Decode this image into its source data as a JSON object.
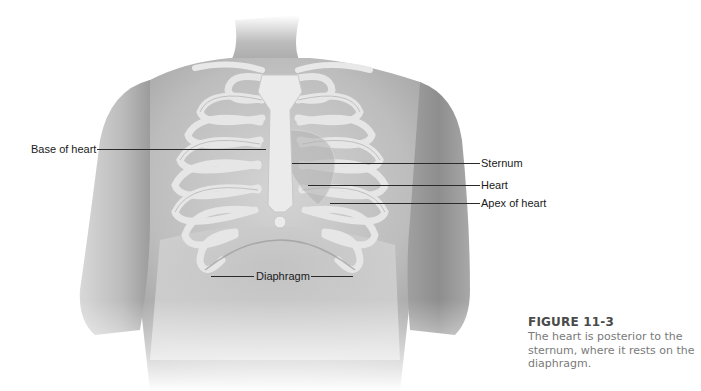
{
  "figure": {
    "illustration": "anterior-torso-rib-cage-heart",
    "labels": {
      "base_of_heart": "Base of heart",
      "sternum": "Sternum",
      "heart": "Heart",
      "apex_of_heart": "Apex of heart",
      "diaphragm": "Diaphragm"
    },
    "caption": {
      "title": "FIGURE 11-3",
      "text": "The heart is posterior to the sternum, where it rests on the diaphragm."
    },
    "colors": {
      "skin": "#c9c9c9",
      "skin_shadow": "#9e9e9e",
      "bone": "#e6e6e6",
      "leader_line": "#2a2a2a",
      "caption_title": "#4a4a4a",
      "caption_text": "#7a7a7a"
    }
  }
}
